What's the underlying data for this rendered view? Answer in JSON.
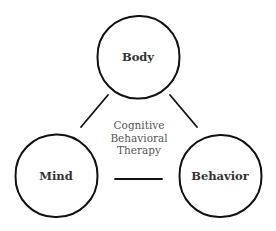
{
  "diagram": {
    "title_lines": [
      "Cognitive",
      "Behavioral",
      "Therapy"
    ],
    "nodes": [
      {
        "id": "body",
        "label": "Body"
      },
      {
        "id": "mind",
        "label": "Mind"
      },
      {
        "id": "behavior",
        "label": "Behavior"
      }
    ],
    "edges": [
      {
        "from": "body",
        "to": "mind"
      },
      {
        "from": "body",
        "to": "behavior"
      },
      {
        "from": "mind",
        "to": "behavior"
      }
    ],
    "colors": {
      "stroke": "#111111",
      "node_text": "#333333",
      "center_text": "#555555",
      "background": "#ffffff"
    }
  }
}
